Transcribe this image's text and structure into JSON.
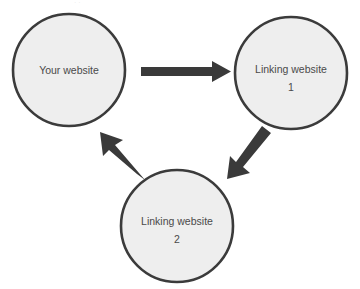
{
  "diagram": {
    "type": "cycle-diagram",
    "canvas": {
      "width": 360,
      "height": 289,
      "background": "#ffffff"
    },
    "style": {
      "node_fill": "#eeeeee",
      "node_stroke": "#3b3b3b",
      "label_color": "#4a4a4a",
      "arrow_color": "#3a3a3a"
    },
    "nodes": [
      {
        "id": "your-website",
        "line1": "Your website",
        "line2": "",
        "cx": 69,
        "cy": 70,
        "r": 57
      },
      {
        "id": "linking-website-1",
        "line1": "Linking website",
        "line2": "1",
        "cx": 291,
        "cy": 73,
        "r": 57
      },
      {
        "id": "linking-website-2",
        "line1": "Linking website",
        "line2": "2",
        "cx": 177,
        "cy": 226,
        "r": 57
      }
    ],
    "arrows": [
      {
        "id": "arrow-your-website-to-linking-1",
        "from": "your-website",
        "to": "linking-website-1",
        "direction": "right",
        "label": ""
      },
      {
        "id": "arrow-linking-1-to-linking-2",
        "from": "linking-website-1",
        "to": "linking-website-2",
        "direction": "down-left",
        "label": ""
      },
      {
        "id": "arrow-linking-2-to-your-website",
        "from": "linking-website-2",
        "to": "your-website",
        "direction": "up-left",
        "label": ""
      }
    ],
    "top_artifact_text": "·  ·"
  }
}
